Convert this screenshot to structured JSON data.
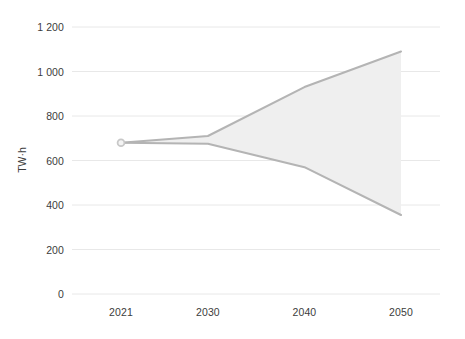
{
  "chart_data": {
    "type": "area",
    "title": "",
    "subtitle": "",
    "xlabel": "",
    "ylabel": "TW·h",
    "x": [
      2021,
      2030,
      2040,
      2050
    ],
    "xlim": [
      2021,
      2050
    ],
    "ylim": [
      0,
      1200
    ],
    "grid": true,
    "legend": false,
    "legend_position": "none",
    "series": [
      {
        "name": "High scenario",
        "values": [
          680,
          710,
          930,
          1090
        ]
      },
      {
        "name": "Low scenario",
        "values": [
          680,
          675,
          570,
          355
        ]
      }
    ],
    "band": {
      "name": "Projection range",
      "x": [
        2021,
        2030,
        2040,
        2050
      ],
      "upper": [
        680,
        710,
        930,
        1090
      ],
      "lower": [
        680,
        675,
        570,
        355
      ],
      "fill_color": "#efefef",
      "edge_color": "#b4b4b4"
    },
    "markers": [
      {
        "x": 2021,
        "y": 680,
        "label": "",
        "color": "#c8c8c8"
      }
    ],
    "y_ticks": [
      0,
      200,
      400,
      600,
      800,
      1000,
      1200
    ],
    "y_tick_labels": [
      "0",
      "200",
      "400",
      "600",
      "800",
      "1 000",
      "1 200"
    ],
    "x_ticks": [
      2021,
      2030,
      2040,
      2050
    ],
    "x_tick_labels": [
      "2021",
      "2030",
      "2040",
      "2050"
    ],
    "colors": {
      "background": "#ffffff",
      "grid": "#e8e8e8",
      "band_fill": "#efefef",
      "band_edge": "#b4b4b4",
      "text": "#3c3c3c"
    }
  }
}
